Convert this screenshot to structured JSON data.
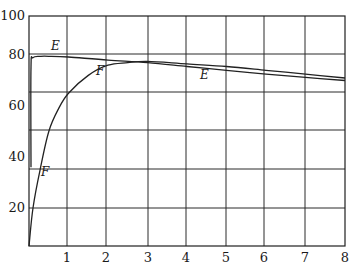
{
  "chart_data": {
    "type": "line",
    "title": "",
    "xlabel": "",
    "ylabel": "",
    "xlim": [
      0,
      8
    ],
    "ylim": [
      0,
      100
    ],
    "grid": true,
    "legend": "none (inline curve labels)",
    "x_ticks": [
      "1",
      "2",
      "3",
      "4",
      "5",
      "6",
      "7",
      "8"
    ],
    "y_ticks": [
      "20",
      "40",
      "60",
      "80",
      "100"
    ],
    "series": [
      {
        "name": "E",
        "x": [
          0.05,
          0.05,
          0.1,
          0.3,
          0.5,
          1,
          2,
          3,
          4,
          5,
          6,
          7,
          8
        ],
        "y": [
          36,
          75,
          79,
          79.5,
          79.5,
          79.2,
          78,
          77,
          75.5,
          74,
          72.5,
          71.2,
          70
        ]
      },
      {
        "name": "F",
        "x": [
          0,
          0.1,
          0.28,
          0.5,
          0.75,
          1,
          1.5,
          2,
          2.5,
          3,
          4,
          5,
          6,
          7,
          8
        ],
        "y": [
          0,
          20,
          35,
          50,
          59,
          65,
          72,
          76,
          77,
          77.5,
          76.5,
          75.5,
          74,
          72.5,
          71
        ]
      }
    ],
    "annotations": [
      {
        "text": "E",
        "x": 0.7,
        "y": 83
      },
      {
        "text": "F",
        "x": 1.8,
        "y": 70
      },
      {
        "text": "E",
        "x": 4.4,
        "y": 70
      },
      {
        "text": "F",
        "x": 0.35,
        "y": 34
      }
    ]
  },
  "axes": {
    "y_tick_labels": [
      {
        "text": "100",
        "px_y": 20
      },
      {
        "text": "80",
        "px_y": 59
      },
      {
        "text": "60",
        "px_y": 110
      },
      {
        "text": "40",
        "px_y": 161
      },
      {
        "text": "20",
        "px_y": 212
      }
    ],
    "x_tick_labels": [
      {
        "text": "1",
        "px_x": 67
      },
      {
        "text": "2",
        "px_x": 106
      },
      {
        "text": "3",
        "px_x": 148
      },
      {
        "text": "4",
        "px_x": 186
      },
      {
        "text": "5",
        "px_x": 226
      },
      {
        "text": "6",
        "px_x": 264
      },
      {
        "text": "7",
        "px_x": 305
      },
      {
        "text": "8",
        "px_x": 345
      }
    ]
  },
  "labels": {
    "e_top": "E",
    "f_mid": "F",
    "e_right": "E",
    "f_low": "F"
  }
}
